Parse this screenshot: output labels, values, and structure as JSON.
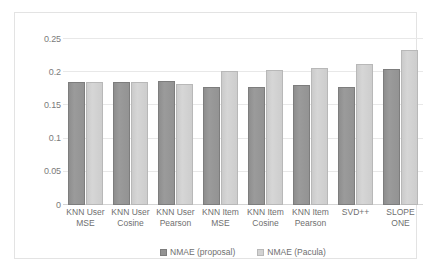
{
  "chart_data": {
    "type": "bar",
    "title": "",
    "subtitle": "",
    "xlabel": "",
    "ylabel": "",
    "ylim": [
      0,
      0.25
    ],
    "grid": true,
    "legend_position": "bottom",
    "categories": [
      "KNN User\nMSE",
      "KNN User\nCosine",
      "KNN User\nPearson",
      "KNN Item\nMSE",
      "KNN Item\nCosine",
      "KNN Item\nPearson",
      "SVD++",
      "SLOPE\nONE"
    ],
    "ytick_labels": [
      "0",
      "0.05",
      "0.1",
      "0.15",
      "0.2",
      "0.25"
    ],
    "ytick_values": [
      0,
      0.05,
      0.1,
      0.15,
      0.2,
      0.25
    ],
    "series": [
      {
        "name": "NMAE (proposal)",
        "color": "#939393",
        "values": [
          0.185,
          0.185,
          0.187,
          0.178,
          0.177,
          0.181,
          0.178,
          0.205
        ]
      },
      {
        "name": "NMAE (Pacula)",
        "color": "#d2d2d2",
        "values": [
          0.185,
          0.185,
          0.183,
          0.202,
          0.203,
          0.207,
          0.213,
          0.234
        ]
      }
    ]
  },
  "legend": {
    "items": [
      {
        "label": "NMAE (proposal)",
        "swatch": "series-0"
      },
      {
        "label": "NMAE (Pacula)",
        "swatch": "series-1"
      }
    ]
  }
}
